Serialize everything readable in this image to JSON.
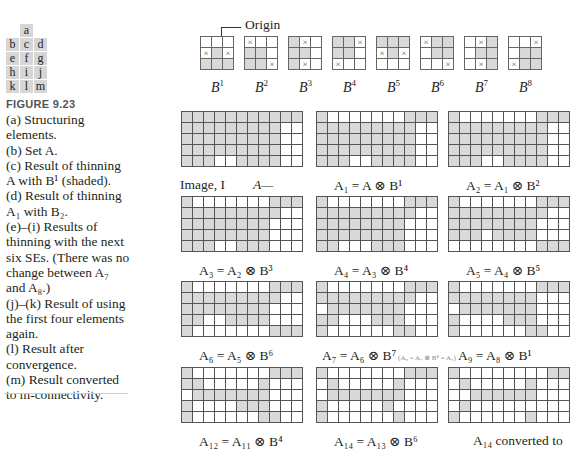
{
  "figure": {
    "number": "FIGURE 9.23",
    "letter_grid": [
      [
        "",
        "a",
        ""
      ],
      [
        "b",
        "c",
        "d"
      ],
      [
        "e",
        "f",
        "g"
      ],
      [
        "h",
        "i",
        "j"
      ],
      [
        "k",
        "l",
        "m"
      ]
    ],
    "caption_lines": [
      "(a) Structuring",
      "elements.",
      "(b) Set A.",
      "(c) Result of thinning",
      "A with B¹ (shaded).",
      "(d) Result of thinning",
      "A₁ with B₂.",
      "(e)–(i) Results of",
      "thinning with the next",
      "six SEs. (There was no",
      "change between A₇",
      "and A₈.)",
      "(j)–(k) Result of using",
      "the first four elements",
      "again.",
      "(l) Result after",
      "convergence.",
      "(m) Result converted",
      "to m-connectivity."
    ]
  },
  "structuring_elements": {
    "origin_label": "Origin",
    "items": [
      {
        "label": "B",
        "sup": "1",
        "cells": [
          "0",
          "0",
          "0",
          "x",
          "1",
          "x",
          "1",
          "1",
          "1"
        ]
      },
      {
        "label": "B",
        "sup": "2",
        "cells": [
          "x",
          "0",
          "0",
          "1",
          "1",
          "0",
          "1",
          "1",
          "x"
        ]
      },
      {
        "label": "B",
        "sup": "3",
        "cells": [
          "1",
          "x",
          "0",
          "1",
          "1",
          "0",
          "1",
          "x",
          "0"
        ]
      },
      {
        "label": "B",
        "sup": "4",
        "cells": [
          "1",
          "1",
          "x",
          "1",
          "1",
          "0",
          "x",
          "0",
          "0"
        ]
      },
      {
        "label": "B",
        "sup": "5",
        "cells": [
          "1",
          "1",
          "1",
          "x",
          "1",
          "x",
          "0",
          "0",
          "0"
        ]
      },
      {
        "label": "B",
        "sup": "6",
        "cells": [
          "x",
          "1",
          "1",
          "0",
          "1",
          "1",
          "0",
          "0",
          "x"
        ]
      },
      {
        "label": "B",
        "sup": "7",
        "cells": [
          "0",
          "x",
          "1",
          "0",
          "1",
          "1",
          "0",
          "x",
          "1"
        ]
      },
      {
        "label": "B",
        "sup": "8",
        "cells": [
          "0",
          "0",
          "x",
          "0",
          "1",
          "1",
          "x",
          "1",
          "1"
        ]
      }
    ]
  },
  "panels": [
    {
      "label": "Image, I",
      "annotation": "A",
      "rows": [
        "11111111111",
        "11111111100",
        "11111111100",
        "11111111100",
        "11100111100"
      ]
    },
    {
      "label": "A₁ = A ⊗ B¹",
      "rows": [
        "10000000111",
        "11111111100",
        "11111111100",
        "11111111100",
        "11100111100"
      ]
    },
    {
      "label": "A₂ = A₁ ⊗ B²",
      "rows": [
        "10000000111",
        "11111111100",
        "11111111100",
        "11111111100",
        "11100111100"
      ]
    },
    {
      "label": "A₃ = A₂ ⊗ B³",
      "rows": [
        "10000000111",
        "11111111100",
        "11111111000",
        "11111111000",
        "11100111000"
      ]
    },
    {
      "label": "A₄ = A₃ ⊗ B⁴",
      "rows": [
        "10000000111",
        "11111111100",
        "11111111000",
        "11111111000",
        "11000111000"
      ]
    },
    {
      "label": "A₅ = A₄ ⊗ B⁵",
      "rows": [
        "10000000111",
        "11111111100",
        "11111111000",
        "11101111000",
        "00000000111"
      ]
    },
    {
      "label": "A₆ = A₅ ⊗ B⁶",
      "rows": [
        "10000000111",
        "11111111100",
        "11111111000",
        "11001111000",
        "10000000111"
      ]
    },
    {
      "label": "A₇ = A₆ ⊗ B⁷",
      "note": "(A₈ = A₇ ⊗ B⁸ = A₇)",
      "rows": [
        "10000000111",
        "11111111100",
        "01111111000",
        "11000111000",
        "10000001100"
      ]
    },
    {
      "label": "A₉ = A₈ ⊗ B¹",
      "rows": [
        "10000000111",
        "11111111000",
        "01111111000",
        "10000111000",
        "10000001100"
      ]
    },
    {
      "label": "A₁₂ = A₁₁ ⊗ B⁴",
      "rows": [
        "10000000111",
        "11000001000",
        "01111111000",
        "10000111000",
        "10000001100"
      ]
    },
    {
      "label": "A₁₄ = A₁₃ ⊗ B⁶",
      "rows": [
        "10000000111",
        "01000001000",
        "01111111000",
        "10000010000",
        "10000001000"
      ]
    },
    {
      "label": "A₁₄ converted to",
      "rows": [
        "10000000011",
        "01000001000",
        "00111111000",
        "01000000000",
        "10000001000"
      ]
    }
  ],
  "colors": {
    "shade": "#d9d9d9",
    "grid": "#555555",
    "text": "#231f20"
  }
}
